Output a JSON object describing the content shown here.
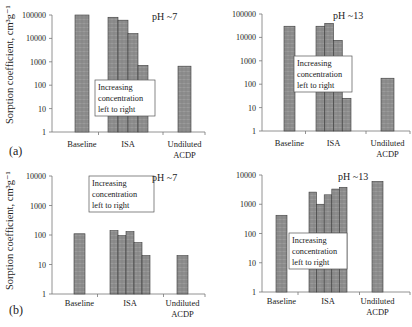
{
  "figure": {
    "ylabel": "Sorption coefficient, cm³g⁻¹",
    "panel_labels": [
      "(a)",
      "(b)"
    ],
    "annotation": [
      "Increasing",
      "concentration",
      "left to right"
    ],
    "bar_color": "#8c8c8c",
    "bar_stroke": "#3a3a3a"
  },
  "chart_data": [
    {
      "id": "a-ph7",
      "type": "bar",
      "panel": "(a)",
      "title": "pH ~7",
      "ylabel": "Sorption coefficient, cm3g-1",
      "yscale": "log",
      "ylim": [
        1,
        100000
      ],
      "yticks": [
        1,
        10,
        100,
        1000,
        10000,
        100000
      ],
      "categories": [
        "Baseline",
        "ISA",
        "Undiluted ACDP"
      ],
      "groups": [
        {
          "category": "Baseline",
          "values": [
            100000
          ]
        },
        {
          "category": "ISA",
          "values": [
            80000,
            60000,
            16000,
            700
          ]
        },
        {
          "category": "Undiluted ACDP",
          "values": [
            650
          ]
        }
      ],
      "annotation": "Increasing concentration left to right"
    },
    {
      "id": "a-ph13",
      "type": "bar",
      "panel": "(a)",
      "title": "pH ~13",
      "ylabel": "Sorption coefficient, cm3g-1",
      "yscale": "log",
      "ylim": [
        1,
        100000
      ],
      "yticks": [
        1,
        10,
        100,
        1000,
        10000,
        100000
      ],
      "categories": [
        "Baseline",
        "ISA",
        "Undiluted ACDP"
      ],
      "groups": [
        {
          "category": "Baseline",
          "values": [
            30000
          ]
        },
        {
          "category": "ISA",
          "values": [
            30000,
            40000,
            7500,
            25
          ]
        },
        {
          "category": "Undiluted ACDP",
          "values": [
            180
          ]
        }
      ],
      "annotation": "Increasing concentration left to right"
    },
    {
      "id": "b-ph7",
      "type": "bar",
      "panel": "(b)",
      "title": "pH ~7",
      "ylabel": "Sorption coefficient, cm3g-1",
      "yscale": "log",
      "ylim": [
        1,
        10000
      ],
      "yticks": [
        1,
        10,
        100,
        1000,
        10000
      ],
      "categories": [
        "Baseline",
        "ISA",
        "Undiluted ACDP"
      ],
      "groups": [
        {
          "category": "Baseline",
          "values": [
            110
          ]
        },
        {
          "category": "ISA",
          "values": [
            140,
            95,
            130,
            55,
            20
          ]
        },
        {
          "category": "Undiluted ACDP",
          "values": [
            20
          ]
        }
      ],
      "annotation": "Increasing concentration left to right"
    },
    {
      "id": "b-ph13",
      "type": "bar",
      "panel": "(b)",
      "title": "pH ~13",
      "ylabel": "Sorption coefficient, cm3g-1",
      "yscale": "log",
      "ylim": [
        1,
        10000
      ],
      "yticks": [
        1,
        10,
        100,
        1000,
        10000
      ],
      "categories": [
        "Baseline",
        "ISA",
        "Undiluted ACDP"
      ],
      "groups": [
        {
          "category": "Baseline",
          "values": [
            420
          ]
        },
        {
          "category": "ISA",
          "values": [
            2600,
            1000,
            2100,
            3300,
            3800
          ]
        },
        {
          "category": "Undiluted ACDP",
          "values": [
            6000
          ]
        }
      ],
      "annotation": "Increasing concentration left to right"
    }
  ]
}
